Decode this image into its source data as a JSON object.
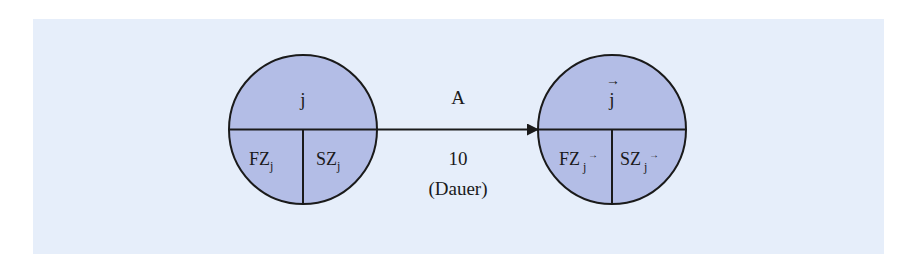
{
  "diagram": {
    "type": "network-plan-arrow",
    "background_color": "#e6eefa",
    "node_fill": "#b3bde6",
    "stroke_color": "#1a1a1a",
    "start_node": {
      "label": "j",
      "bottom_left": {
        "base": "FZ",
        "sub": "j"
      },
      "bottom_right": {
        "base": "SZ",
        "sub": "j"
      }
    },
    "end_node": {
      "label": "j",
      "label_marker": "→",
      "bottom_left": {
        "base": "FZ",
        "sub": "j",
        "sub_marker": "→"
      },
      "bottom_right": {
        "base": "SZ",
        "sub": "j",
        "sub_marker": "→"
      }
    },
    "edge": {
      "activity": "A",
      "duration": "10",
      "duration_caption": "(Dauer)"
    }
  }
}
